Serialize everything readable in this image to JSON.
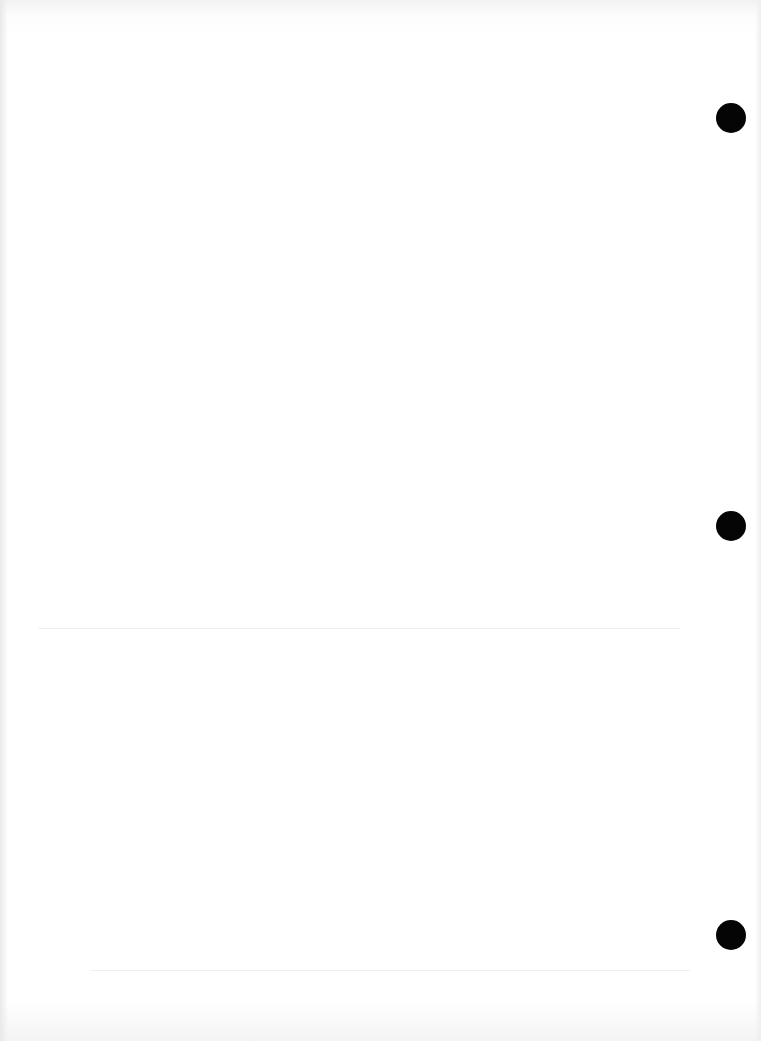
{
  "page": {
    "type": "scanned blank sheet",
    "background": "#ffffff",
    "ghost_text": {
      "top_left": "",
      "top_right": "",
      "lower_band": "",
      "footer_band": ""
    },
    "punch_holes": [
      {
        "cx": 731,
        "cy": 118,
        "d": 30,
        "color": "#050505"
      },
      {
        "cx": 731,
        "cy": 526,
        "d": 30,
        "color": "#050505"
      },
      {
        "cx": 731,
        "cy": 935,
        "d": 30,
        "color": "#050505"
      }
    ],
    "rules": [
      {
        "y": 628,
        "x1": 38,
        "x2": 680
      },
      {
        "y": 970,
        "x1": 90,
        "x2": 690
      }
    ]
  }
}
